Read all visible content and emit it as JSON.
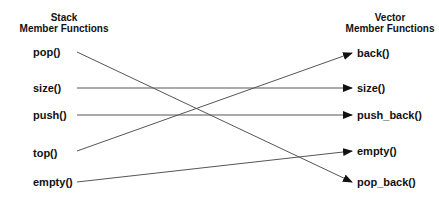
{
  "left_column": {
    "title_line1": "Stack",
    "title_line2": "Member Functions",
    "items": [
      "pop()",
      "size()",
      "push()",
      "top()",
      "empty()"
    ]
  },
  "right_column": {
    "title_line1": "Vector",
    "title_line2": "Member Functions",
    "items": [
      "back()",
      "size()",
      "push_back()",
      "empty()",
      "pop_back()"
    ]
  },
  "mappings": [
    {
      "from": "pop()",
      "to": "pop_back()"
    },
    {
      "from": "size()",
      "to": "size()"
    },
    {
      "from": "push()",
      "to": "push_back()"
    },
    {
      "from": "top()",
      "to": "back()"
    },
    {
      "from": "empty()",
      "to": "empty()"
    }
  ],
  "colors": {
    "line": "#555555",
    "text": "#111111"
  }
}
